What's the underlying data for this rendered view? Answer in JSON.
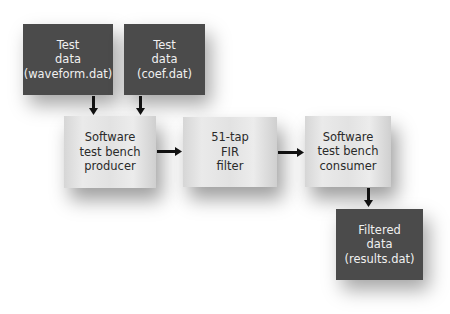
{
  "diagram": {
    "nodes": [
      {
        "id": "waveform-data",
        "label": "Test\ndata\n(waveform.dat)",
        "style": "dark"
      },
      {
        "id": "coef-data",
        "label": "Test\ndata\n(coef.dat)",
        "style": "dark"
      },
      {
        "id": "producer",
        "label": "Software\ntest bench\nproducer",
        "style": "light"
      },
      {
        "id": "fir-filter",
        "label": "51-tap\nFIR\nfilter",
        "style": "light"
      },
      {
        "id": "consumer",
        "label": "Software\ntest bench\nconsumer",
        "style": "light"
      },
      {
        "id": "results-data",
        "label": "Filtered\ndata\n(results.dat)",
        "style": "dark"
      }
    ],
    "edges": [
      {
        "from": "waveform-data",
        "to": "producer"
      },
      {
        "from": "coef-data",
        "to": "producer"
      },
      {
        "from": "producer",
        "to": "fir-filter"
      },
      {
        "from": "fir-filter",
        "to": "consumer"
      },
      {
        "from": "consumer",
        "to": "results-data"
      }
    ],
    "colors": {
      "dark_box": "#4b4b4b",
      "dark_text": "#f0f0f0",
      "light_box": "#e4e4e4",
      "light_text": "#2a2a2a",
      "arrow": "#111111"
    }
  }
}
